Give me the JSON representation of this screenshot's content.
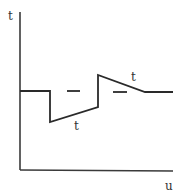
{
  "diagram": {
    "y_axis_label": "t",
    "x_axis_label": "u",
    "curve_labels": [
      "t",
      "t"
    ],
    "line_color": "#2a2a2a",
    "axis_color": "#3a3a3a",
    "curve_points": [
      [
        20,
        91
      ],
      [
        50,
        91
      ],
      [
        50,
        122
      ],
      [
        98,
        107
      ],
      [
        98,
        75
      ],
      [
        145,
        92
      ],
      [
        173,
        92
      ]
    ],
    "dashes": [
      [
        [
          67,
          91
        ],
        [
          80,
          91
        ]
      ],
      [
        [
          113,
          92
        ],
        [
          127,
          92
        ]
      ]
    ]
  }
}
